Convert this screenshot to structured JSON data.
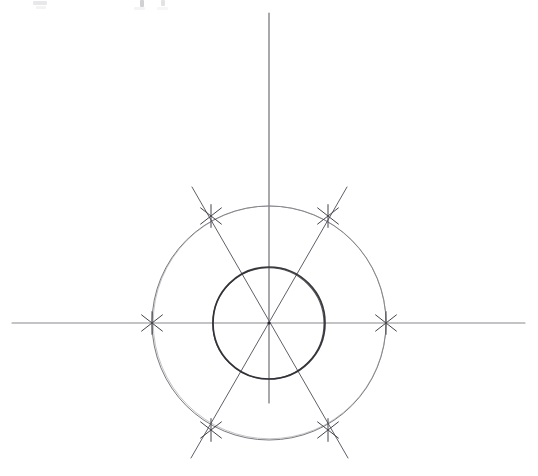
{
  "figure": {
    "background_color": "#ffffff",
    "paper_tone": "#fdfdfd"
  },
  "geometry": {
    "center": {
      "x": 269,
      "y": 323,
      "label": "center-point"
    },
    "outer_circle": {
      "name": "outer-circle",
      "radius": 117,
      "stroke": "#7a7a80",
      "stroke_width": 1.0
    },
    "inner_circle": {
      "name": "inner-circle",
      "radius": 56,
      "stroke": "#3a3a40",
      "stroke_width": 1.7
    },
    "axes": {
      "horizontal": {
        "name": "horizontal-axis",
        "x1": 12,
        "y1": 323,
        "x2": 525,
        "y2": 323,
        "stroke": "#8a8a90",
        "stroke_width": 1.1
      },
      "vertical": {
        "name": "vertical-axis",
        "x1": 269,
        "y1": 13,
        "x2": 269,
        "y2": 403,
        "stroke": "#6e6e76",
        "stroke_width": 1.2
      }
    },
    "diagonals": [
      {
        "name": "diagonal-60",
        "angle_deg": 60,
        "x1": 192,
        "y1": 187,
        "x2": 348,
        "y2": 458,
        "stroke": "#5f5f68",
        "stroke_width": 1.0
      },
      {
        "name": "diagonal-120",
        "angle_deg": 120,
        "x1": 347,
        "y1": 187,
        "x2": 191,
        "y2": 458,
        "stroke": "#5f5f68",
        "stroke_width": 1.0
      }
    ],
    "tick_marks": {
      "stroke": "#45454d",
      "stroke_width": 1.0,
      "arm_length": 13,
      "points": [
        {
          "name": "tick-mark-0deg",
          "angle_deg": 0,
          "x": 386,
          "y": 323
        },
        {
          "name": "tick-mark-60deg",
          "angle_deg": 60,
          "x": 328,
          "y": 216
        },
        {
          "name": "tick-mark-120deg",
          "angle_deg": 120,
          "x": 211,
          "y": 216
        },
        {
          "name": "tick-mark-180deg",
          "angle_deg": 180,
          "x": 152,
          "y": 323
        },
        {
          "name": "tick-mark-240deg",
          "angle_deg": 240,
          "x": 211,
          "y": 430
        },
        {
          "name": "tick-mark-300deg",
          "angle_deg": 300,
          "x": 328,
          "y": 430
        }
      ]
    }
  },
  "annotations": {
    "top_edge_traces": [
      {
        "name": "faint-trace-left",
        "x": 33,
        "y": 1,
        "width": 14,
        "height": 5,
        "opacity": 0.16
      },
      {
        "name": "faint-trace-mid",
        "x": 140,
        "y": 0,
        "width": 5,
        "height": 7,
        "opacity": 0.3
      },
      {
        "name": "faint-trace-right",
        "x": 161,
        "y": 0,
        "width": 5,
        "height": 6,
        "opacity": 0.22
      },
      {
        "name": "faint-trace-far",
        "x": 36,
        "y": 6,
        "width": 10,
        "height": 4,
        "opacity": 0.1
      }
    ]
  },
  "chart_data": {
    "type": "scatter",
    "xlabel": "",
    "ylabel": "",
    "grid": false,
    "legend": null,
    "xlim": [
      -117,
      117
    ],
    "ylim": [
      -117,
      117
    ],
    "series": [
      {
        "name": "Outer circle vertices (hexagon)",
        "radius": 117,
        "angles_deg": [
          0,
          60,
          120,
          180,
          240,
          300
        ],
        "x": [
          117.0,
          58.5,
          -58.5,
          -117.0,
          -58.5,
          58.5
        ],
        "y": [
          0.0,
          101.3,
          101.3,
          0.0,
          -101.3,
          -101.3
        ]
      },
      {
        "name": "Inner circle",
        "radius": 56,
        "angles_deg": [],
        "x": [],
        "y": []
      }
    ],
    "annotations": [
      "6 tick marks equally spaced 60 degrees apart",
      "3 diameters: horizontal, +60 degrees, -60 degrees",
      "vertical axis line through center"
    ]
  }
}
